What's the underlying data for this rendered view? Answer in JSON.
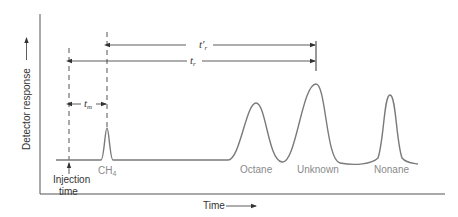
{
  "axes": {
    "y_label": "Detector response",
    "x_label": "Time"
  },
  "injection": {
    "label_line1": "Injection",
    "label_line2": "time"
  },
  "peaks": [
    {
      "name": "CH4",
      "label": "CH",
      "subscript": "4",
      "x": 107,
      "top_y": 128
    },
    {
      "name": "Octane",
      "label": "Octane",
      "x": 256,
      "top_y": 103
    },
    {
      "name": "Unknown",
      "label": "Unknown",
      "x": 316,
      "top_y": 84
    },
    {
      "name": "Nonane",
      "label": "Nonane",
      "x": 390,
      "top_y": 95
    }
  ],
  "intervals": {
    "t_m": {
      "symbol": "t",
      "subscript": "m"
    },
    "t_r": {
      "symbol": "t",
      "subscript": "r"
    },
    "t_r_prime": {
      "symbol": "t′",
      "subscript": "r"
    }
  },
  "colors": {
    "axis": "#555555",
    "trace": "#7a7a7a",
    "text": "#333333",
    "peak_label": "#8a8a8a"
  }
}
